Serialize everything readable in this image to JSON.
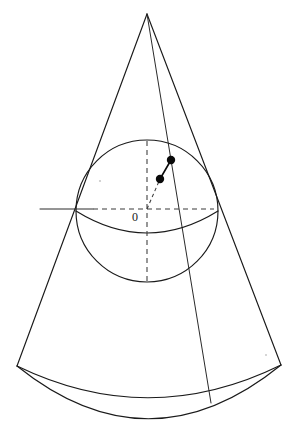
{
  "figure": {
    "background_color": "#ffffff",
    "line_color": "#1a1a1a",
    "dash_color": "#3a3a3a",
    "point_color": "#0a0a0a",
    "width": 301,
    "height": 431
  },
  "labels": {
    "origin": "0"
  },
  "geometry": {
    "apex": {
      "x": 147,
      "y": 14
    },
    "sphere": {
      "cx": 147,
      "cy": 211,
      "r": 71
    },
    "equator_ellipse": {
      "cx": 147,
      "cy": 211,
      "rx": 71,
      "ry": 22
    },
    "base_left_corner": {
      "x": 17,
      "y": 366
    },
    "base_right_corner": {
      "x": 281,
      "y": 365
    },
    "base_arc_bottom": {
      "x": 149,
      "y": 419
    },
    "base_back_arc_bottom": {
      "x": 149,
      "y": 398
    },
    "slant_line_end": {
      "x": 211,
      "y": 403
    },
    "vertical_axis": {
      "x": 147,
      "y_top": 141,
      "y_bottom": 283
    },
    "horizontal_axis": {
      "y": 209,
      "x_left": 40,
      "x_right": 213
    },
    "horizontal_axis_solid_end": {
      "x": 93
    },
    "point_outer": {
      "x": 171,
      "y": 160
    },
    "point_inner": {
      "x": 160,
      "y": 179
    },
    "point_radius": 4.2,
    "tangent_left": {
      "x": 79,
      "y": 205
    },
    "tangent_right": {
      "x": 212,
      "y": 200
    }
  }
}
